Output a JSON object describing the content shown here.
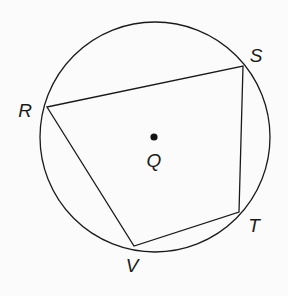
{
  "figure": {
    "type": "cyclic-quadrilateral",
    "circle": {
      "center_label": "Q",
      "cx": 155,
      "cy": 137,
      "r": 115
    },
    "center_point": {
      "label": "Q",
      "x": 154,
      "y": 137,
      "label_x": 154,
      "label_y": 167
    },
    "vertices": [
      {
        "label": "S",
        "x": 243,
        "y": 66,
        "label_x": 256,
        "label_y": 62
      },
      {
        "label": "T",
        "x": 239,
        "y": 212,
        "label_x": 254,
        "label_y": 232
      },
      {
        "label": "V",
        "x": 134,
        "y": 246,
        "label_x": 132,
        "label_y": 272
      },
      {
        "label": "R",
        "x": 47,
        "y": 107,
        "label_x": 25,
        "label_y": 117
      }
    ],
    "polygon_order": [
      "R",
      "S",
      "T",
      "V"
    ],
    "stroke_color": "#1a1a1a",
    "background_color": "#fbfbfb"
  }
}
